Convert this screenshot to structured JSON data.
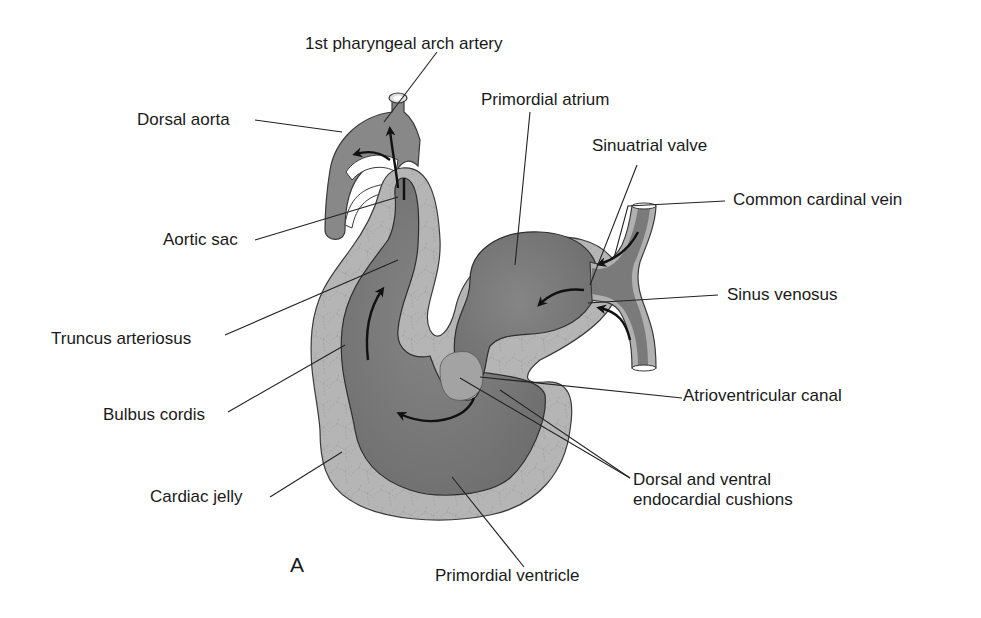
{
  "figure": {
    "panel_letter": "A",
    "colors": {
      "background": "#ffffff",
      "cardiac_jelly": "#b3b3b3",
      "lumen": "#7f7f7f",
      "lumen_dark": "#6e6e6e",
      "vessel": "#8a8a8a",
      "outline": "#3a3a3a",
      "leader": "#222222",
      "arrow": "#111111",
      "text": "#1a1a1a"
    },
    "labels": {
      "pharyngeal_arch_artery": "1st pharyngeal arch artery",
      "dorsal_aorta": "Dorsal aorta",
      "primordial_atrium": "Primordial atrium",
      "sinuatrial_valve": "Sinuatrial valve",
      "common_cardinal_vein": "Common cardinal vein",
      "aortic_sac": "Aortic sac",
      "sinus_venosus": "Sinus venosus",
      "truncus_arteriosus": "Truncus arteriosus",
      "atrioventricular_canal": "Atrioventricular canal",
      "bulbus_cordis": "Bulbus cordis",
      "cardiac_jelly": "Cardiac jelly",
      "endocardial_cushions_line1": "Dorsal and ventral",
      "endocardial_cushions_line2": "endocardial cushions",
      "primordial_ventricle": "Primordial ventricle"
    }
  }
}
